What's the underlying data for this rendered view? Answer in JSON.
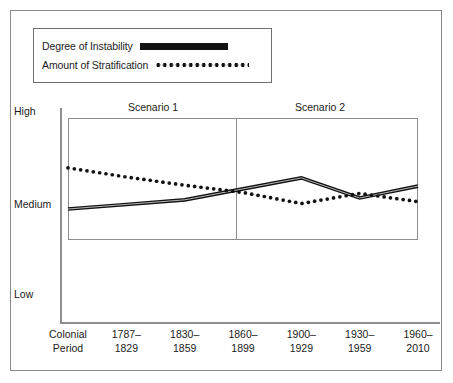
{
  "chart_data": {
    "type": "line",
    "title": "",
    "subtitle": "",
    "xlabel": "",
    "ylabel": "",
    "grid": false,
    "legend_position": "top-left",
    "ylim": [
      "Low",
      "High"
    ],
    "y_tick_labels": [
      "High",
      "Medium",
      "Low"
    ],
    "y_axis_note": "Ordinal scale: Low = 1, Medium = 3, High = 5",
    "categories": [
      "Colonial Period",
      "1787–1829",
      "1830–1859",
      "1860–1899",
      "1900–1929",
      "1930–1959",
      "1960–2010"
    ],
    "annotations": [
      {
        "text": "Scenario 1",
        "covers": [
          "Colonial Period",
          "1787–1829",
          "1830–1859"
        ]
      },
      {
        "text": "Scenario 2",
        "covers": [
          "1860–1899",
          "1900–1929",
          "1930–1959",
          "1960–2010"
        ]
      }
    ],
    "series": [
      {
        "name": "Degree of Instability",
        "style": "solid",
        "color": "#111111",
        "values": [
          2.88,
          2.98,
          3.08,
          3.32,
          3.56,
          3.12,
          3.38
        ]
      },
      {
        "name": "Amount of Stratification",
        "style": "dotted",
        "color": "#111111",
        "values": [
          3.78,
          3.58,
          3.4,
          3.24,
          3.0,
          3.22,
          3.04
        ]
      }
    ]
  },
  "legend": {
    "items": [
      {
        "label": "Degree of Instability",
        "sample": "solid-line-sample"
      },
      {
        "label": "Amount of Stratification",
        "sample": "dotted-line-sample"
      }
    ]
  },
  "y_axis": {
    "high_label": "High",
    "medium_label": "Medium",
    "low_label": "Low"
  },
  "scenarios": {
    "first": "Scenario 1",
    "second": "Scenario 2"
  },
  "x_axis": {
    "ticks": [
      {
        "line1": "Colonial",
        "line2": "Period"
      },
      {
        "line1": "1787–",
        "line2": "1829"
      },
      {
        "line1": "1830–",
        "line2": "1859"
      },
      {
        "line1": "1860–",
        "line2": "1899"
      },
      {
        "line1": "1900–",
        "line2": "1929"
      },
      {
        "line1": "1930–",
        "line2": "1959"
      },
      {
        "line1": "1960–",
        "line2": "2010"
      }
    ]
  },
  "colors": {
    "series": "#111111",
    "frame": "#8d8d8d",
    "outer_border": "#8a8a8a",
    "text": "#1b1b1b",
    "background": "#ffffff"
  }
}
